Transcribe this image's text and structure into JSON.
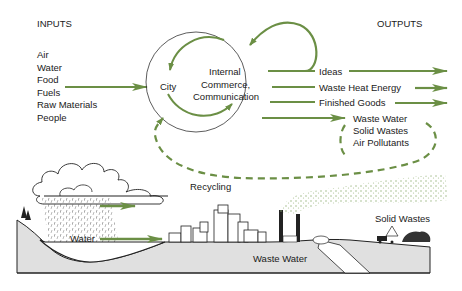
{
  "colors": {
    "accent_green": "#6b8f45",
    "ink": "#1a1a1a",
    "ground": "#d9d9d9",
    "smoke": "#8fae74"
  },
  "headers": {
    "inputs": "INPUTS",
    "outputs": "OUTPUTS"
  },
  "inputs": [
    "Air",
    "Water",
    "Food",
    "Fuels",
    "Raw Materials",
    "People"
  ],
  "city": {
    "label": "City",
    "internal": [
      "Internal",
      "Commerce,",
      "Communication"
    ]
  },
  "outputs": [
    "Ideas",
    "Waste Heat Energy",
    "Finished Goods"
  ],
  "wastes": [
    "Waste Water",
    "Solid Wastes",
    "Air Pollutants"
  ],
  "recycling_label": "Recycling",
  "landscape": {
    "water_label": "Water",
    "waste_water_label": "Waste Water",
    "solid_wastes_label": "Solid Wastes"
  }
}
